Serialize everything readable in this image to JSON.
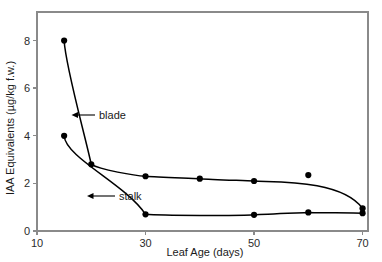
{
  "chart_data": {
    "type": "line",
    "title": "",
    "xlabel": "Leaf Age (days)",
    "ylabel": "IAA Equivalents (µg/kg f.w.)",
    "xlim": [
      10,
      71
    ],
    "ylim": [
      0,
      9.2
    ],
    "xticks": [
      10,
      30,
      50,
      70
    ],
    "xticklabels": [
      "10",
      "30",
      "50",
      "70"
    ],
    "yticks": [
      0,
      2,
      4,
      6,
      8
    ],
    "yticklabels": [
      "0",
      "2",
      "4",
      "6",
      "8"
    ],
    "grid": false,
    "legend": "inline-annotations",
    "frame": "full-box",
    "marker": "filled-circle",
    "series": [
      {
        "name": "blade",
        "x": [
          15,
          20,
          30,
          40,
          50,
          60,
          70
        ],
        "values": [
          8.0,
          2.8,
          2.3,
          2.2,
          2.1,
          2.35,
          0.95
        ]
      },
      {
        "name": "stalk",
        "x": [
          15,
          30,
          50,
          60,
          70
        ],
        "values": [
          4.0,
          0.7,
          0.68,
          0.78,
          0.75
        ]
      }
    ],
    "annotations": [
      {
        "label": "blade",
        "points_to_series": "blade"
      },
      {
        "label": "stalk",
        "points_to_series": "stalk"
      }
    ]
  },
  "colors": {
    "background": "#ffffff",
    "axis": "#8a8a8a",
    "data": "#000000",
    "text": "#1a1a1a"
  }
}
